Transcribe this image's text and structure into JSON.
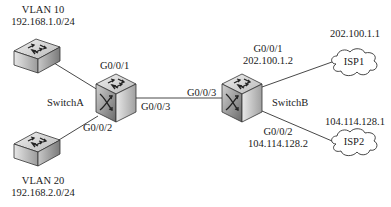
{
  "diagram": {
    "type": "network-topology",
    "nodes": {
      "vlan10": {
        "kind": "access-switch",
        "title": "VLAN 10",
        "subnet": "192.168.1.0/24"
      },
      "vlan20": {
        "kind": "access-switch",
        "title": "VLAN 20",
        "subnet": "192.168.2.0/24"
      },
      "switchA": {
        "kind": "layer3-switch",
        "name": "SwitchA",
        "ports": {
          "g1": "G0/0/1",
          "g2": "G0/0/2",
          "g3": "G0/0/3"
        }
      },
      "switchB": {
        "kind": "layer3-switch",
        "name": "SwitchB",
        "ports": {
          "g1": "G0/0/1",
          "g1_ip": "202.100.1.2",
          "g2": "G0/0/2",
          "g2_ip": "104.114.128.2",
          "g3": "G0/0/3"
        }
      },
      "isp1": {
        "kind": "cloud",
        "name": "ISP1",
        "ip": "202.100.1.1"
      },
      "isp2": {
        "kind": "cloud",
        "name": "ISP2",
        "ip": "104.114.128.1"
      }
    },
    "links": [
      {
        "from": "vlan10",
        "to": "switchA",
        "port": "G0/0/1"
      },
      {
        "from": "vlan20",
        "to": "switchA",
        "port": "G0/0/2"
      },
      {
        "from": "switchA",
        "to": "switchB",
        "port_a": "G0/0/3",
        "port_b": "G0/0/3"
      },
      {
        "from": "switchB",
        "to": "isp1",
        "port": "G0/0/1"
      },
      {
        "from": "switchB",
        "to": "isp2",
        "port": "G0/0/2"
      }
    ],
    "colors": {
      "line": "#333333",
      "text": "#1a1a1a",
      "switch_top": "#d6d6d6",
      "switch_side": "#a8a8a8",
      "switch_front": "#8a8a8a",
      "cloud_fill": "#ffffff"
    }
  }
}
